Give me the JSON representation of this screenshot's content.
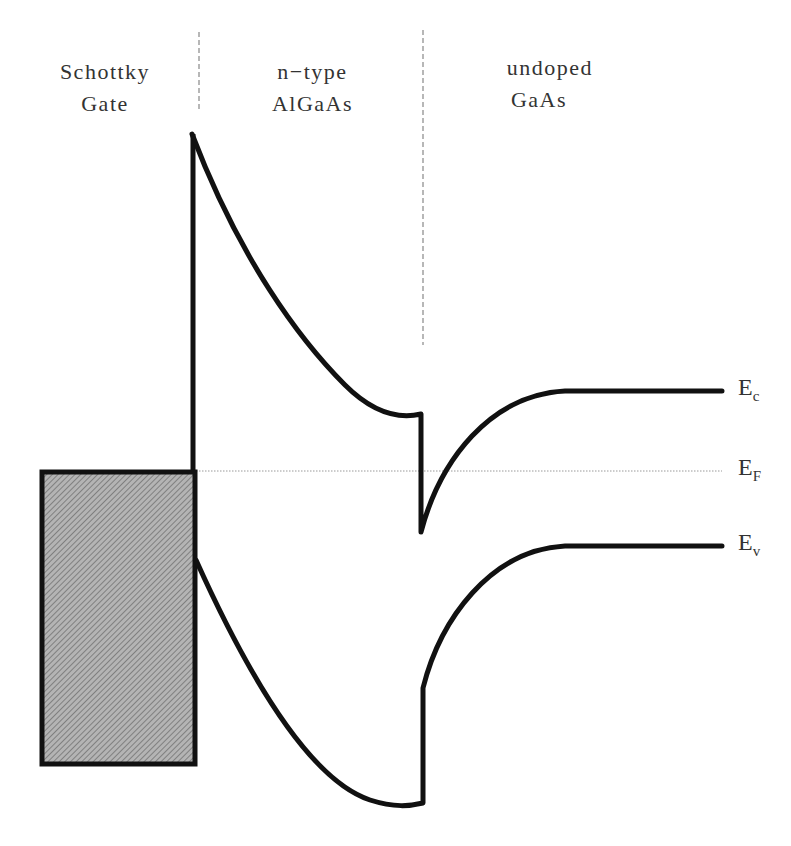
{
  "regions": [
    {
      "line1": "Schottky",
      "line2": "Gate"
    },
    {
      "line1": "n−type",
      "line2": "AlGaAs"
    },
    {
      "line1": "undoped",
      "line2": "GaAs"
    }
  ],
  "bands": {
    "conduction": {
      "letter": "E",
      "sub": "c"
    },
    "fermi": {
      "letter": "E",
      "sub": "F"
    },
    "valence": {
      "letter": "E",
      "sub": "v"
    }
  },
  "colors": {
    "line": "#111111",
    "gate_fill": "#a8a8a8",
    "divider": "#888888"
  }
}
